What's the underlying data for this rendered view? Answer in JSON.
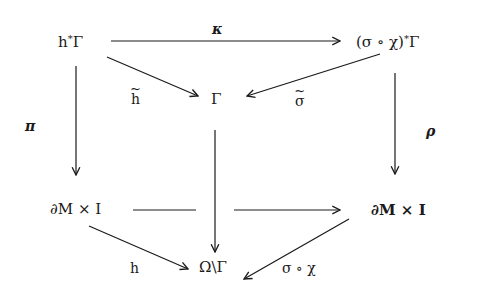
{
  "diagram": {
    "type": "commutative-diagram",
    "nodes": {
      "top_left": "h*Γ",
      "top_right": "(σ ∘ χ)*Γ",
      "center_top": "Γ",
      "mid_left": "∂M × I",
      "mid_right": "∂M × I",
      "bottom_center": "Ω\\Γ"
    },
    "node_parts": {
      "top_left": {
        "base": "h",
        "sup": "*",
        "tail": "Γ"
      },
      "top_right": {
        "base": "(σ ∘ χ)",
        "sup": "*",
        "tail": "Γ"
      }
    },
    "labels": {
      "kappa": "κ",
      "h_tilde": "h",
      "sigma_tilde": "σ",
      "pi": "π",
      "rho": "ρ",
      "h": "h",
      "sigma_chi": "σ ∘ χ"
    },
    "arrows": [
      {
        "from": "h*Γ",
        "to": "(σ ∘ χ)*Γ",
        "label": "κ"
      },
      {
        "from": "h*Γ",
        "to": "Γ",
        "label": "h̃"
      },
      {
        "from": "(σ ∘ χ)*Γ",
        "to": "Γ",
        "label": "σ̃"
      },
      {
        "from": "h*Γ",
        "to": "∂M × I",
        "label": "π"
      },
      {
        "from": "(σ ∘ χ)*Γ",
        "to": "∂M × I",
        "label": "ρ"
      },
      {
        "from": "Γ",
        "to": "Ω\\Γ",
        "label": ""
      },
      {
        "from": "∂M × I",
        "to": "∂M × I",
        "label": ""
      },
      {
        "from": "∂M × I",
        "to": "Ω\\Γ",
        "label": "h"
      },
      {
        "from": "∂M × I",
        "to": "Ω\\Γ",
        "label": "σ ∘ χ"
      }
    ],
    "colors": {
      "ink": "#1a1a1a",
      "background": "#ffffff"
    }
  }
}
